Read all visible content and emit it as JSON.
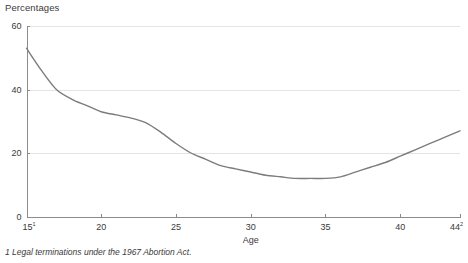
{
  "chart_data": {
    "type": "line",
    "title": "Percentages",
    "xlabel": "Age",
    "ylabel": "Percentages",
    "xlim": [
      15,
      44
    ],
    "ylim": [
      0,
      60
    ],
    "grid": true,
    "legend": null,
    "y_ticks": [
      0,
      20,
      40,
      60
    ],
    "y_tick_labels": [
      "0",
      "20",
      "40",
      "60"
    ],
    "x_ticks": [
      15,
      20,
      25,
      30,
      35,
      40,
      44
    ],
    "x_tick_labels": [
      "15",
      "20",
      "25",
      "30",
      "35",
      "40",
      "44"
    ],
    "x_tick_superscripts": [
      "1",
      "",
      "",
      "",
      "",
      "",
      "2"
    ],
    "series": [
      {
        "name": "Percentage of conceptions leading to legal termination",
        "color": "#7c7c7c",
        "x": [
          15,
          16,
          17,
          18,
          19,
          20,
          21,
          22,
          23,
          24,
          25,
          26,
          27,
          28,
          29,
          30,
          31,
          32,
          33,
          34,
          35,
          36,
          37,
          38,
          39,
          40,
          41,
          42,
          43,
          44
        ],
        "y": [
          53,
          46,
          40,
          37,
          35,
          33,
          32,
          31,
          29.5,
          26.5,
          23,
          20,
          18,
          16,
          15,
          14,
          13,
          12.5,
          12,
          12,
          12,
          12.5,
          14,
          15.5,
          17,
          19,
          21,
          23,
          25,
          27
        ]
      }
    ],
    "annotations": []
  },
  "footnote": {
    "text": "1 Legal terminations under the 1967 Abortion Act."
  }
}
